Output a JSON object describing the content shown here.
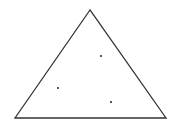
{
  "diagram": {
    "shape": "triangle",
    "stroke_color": "#333333",
    "point_color": "#222222",
    "point_count": 3
  }
}
